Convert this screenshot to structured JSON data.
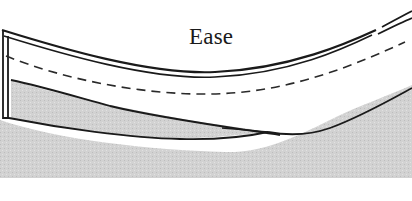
{
  "diagram": {
    "label": "Ease",
    "label_pos": {
      "x": 189,
      "y": 24
    },
    "colors": {
      "background": "#ffffff",
      "shading": "#d4d4d4",
      "outline": "#1a1a1a",
      "dashed_line": "#2a2a2a",
      "label": "#1a1a1a"
    },
    "parts": [
      {
        "id": "garment-layer",
        "description": "curved upper fabric layer with double outline"
      },
      {
        "id": "seamline",
        "description": "dashed seam line following curve"
      },
      {
        "id": "lower-layer",
        "description": "shaded underlayer tapering to a point"
      }
    ]
  }
}
